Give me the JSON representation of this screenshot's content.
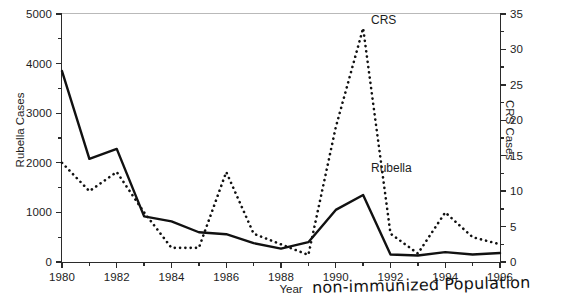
{
  "chart_data": {
    "type": "line",
    "title": "",
    "xlabel": "Year",
    "ylabel": "Rubella Cases",
    "y2label": "CRS Cases",
    "grid": false,
    "legend_position": "inline-annotations",
    "x": [
      1980,
      1981,
      1982,
      1983,
      1984,
      1985,
      1986,
      1987,
      1988,
      1989,
      1990,
      1991,
      1992,
      1993,
      1994,
      1995,
      1996
    ],
    "xlim": [
      1980,
      1996
    ],
    "xticks": [
      1980,
      1981,
      1982,
      1983,
      1984,
      1985,
      1986,
      1987,
      1988,
      1989,
      1990,
      1991,
      1992,
      1993,
      1994,
      1995,
      1996
    ],
    "xtick_labels_shown": [
      "1980",
      "1982",
      "1984",
      "1986",
      "1988",
      "1990",
      "1992",
      "1994",
      "1996"
    ],
    "ylim": [
      0,
      5000
    ],
    "yticks": [
      0,
      1000,
      2000,
      3000,
      4000,
      5000
    ],
    "ytick_minor_step": 500,
    "y2lim": [
      0,
      35
    ],
    "y2ticks": [
      0,
      5,
      10,
      15,
      20,
      25,
      30,
      35
    ],
    "y2tick_minor_step": 2.5,
    "series": [
      {
        "name": "Rubella",
        "axis": "left",
        "style": "solid",
        "color": "#111111",
        "label_text": "Rubella",
        "values": [
          3850,
          2080,
          2280,
          920,
          820,
          600,
          560,
          380,
          270,
          400,
          1050,
          1350,
          150,
          130,
          200,
          150,
          180
        ]
      },
      {
        "name": "CRS",
        "axis": "right",
        "style": "dotted",
        "color": "#111111",
        "label_text": "CRS",
        "values": [
          14,
          10,
          12.7,
          7,
          2,
          2,
          12.7,
          4,
          2.5,
          1,
          19,
          33,
          4,
          1.2,
          7,
          3.5,
          2.5
        ]
      }
    ]
  },
  "annotations": {
    "handwritten_note": "non-immunized Population",
    "caption_remnant": ""
  },
  "axes": {
    "left_tick_labels": [
      "5000",
      "4000",
      "3000",
      "2000",
      "1000",
      "0"
    ],
    "right_tick_labels": [
      "35",
      "30",
      "25",
      "20",
      "15",
      "10",
      "5",
      "0"
    ],
    "bottom_tick_labels": [
      "1980",
      "1982",
      "1984",
      "1986",
      "1988",
      "1990",
      "1992",
      "1994",
      "1996"
    ],
    "left_title": "Rubella Cases",
    "right_title": "CRS Cases",
    "bottom_title": "Year"
  }
}
